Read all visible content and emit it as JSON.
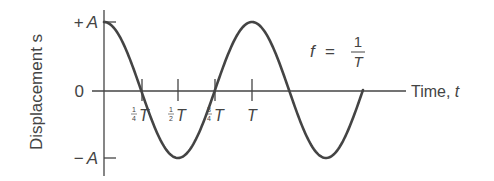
{
  "diagram": {
    "y_axis": {
      "label": "Displacement s",
      "ticks": [
        {
          "label": "+A",
          "value": 1
        },
        {
          "label": "0",
          "value": 0
        },
        {
          "label": "−A",
          "value": -1
        }
      ]
    },
    "x_axis": {
      "label": "Time, t",
      "ticks": [
        {
          "frac_num": "1",
          "frac_den": "4",
          "sym": "T",
          "value": 0.25
        },
        {
          "frac_num": "1",
          "frac_den": "2",
          "sym": "T",
          "value": 0.5
        },
        {
          "frac_num": "3",
          "frac_den": "4",
          "sym": "T",
          "value": 0.75
        },
        {
          "frac_num": "",
          "frac_den": "",
          "sym": "T",
          "value": 1.0
        }
      ]
    },
    "formula": {
      "lhs": "f",
      "eq": "=",
      "num": "1",
      "den": "T"
    },
    "curve": {
      "type": "cosine",
      "amplitude": "A",
      "periods_shown": 1.75,
      "color": "#444444"
    }
  }
}
